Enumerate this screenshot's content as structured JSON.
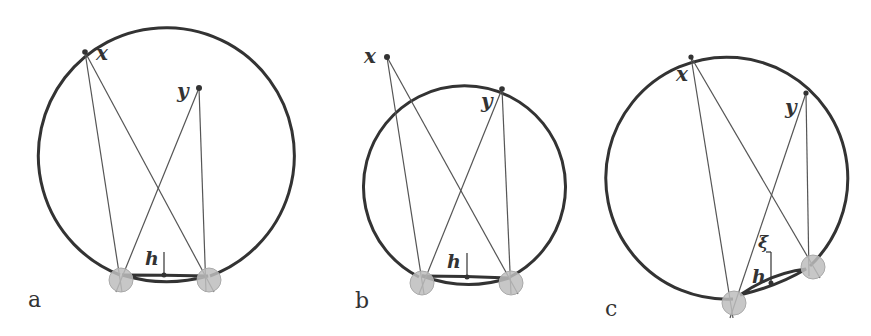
{
  "figure": {
    "panels": [
      {
        "id": "a",
        "label": "a",
        "point_labels": {
          "x": "x",
          "y": "y",
          "h": "h"
        }
      },
      {
        "id": "b",
        "label": "b",
        "point_labels": {
          "x": "x",
          "y": "y",
          "h": "h"
        }
      },
      {
        "id": "c",
        "label": "c",
        "point_labels": {
          "x": "x",
          "y": "y",
          "h": "h",
          "xi": "ξ"
        }
      }
    ]
  }
}
